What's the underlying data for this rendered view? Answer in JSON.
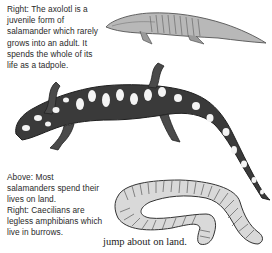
{
  "captions": {
    "axolotl": "Right: The axolotl is a juvenile form of salamander which rarely grows into an adult. It spends the whole of its life as a tadpole.",
    "salamander": "Above: Most salamanders spend their lives on land.",
    "caecilian": "Right: Caecilians are legless amphibians which live in burrows."
  },
  "body_text": "jump about on land.",
  "illustrations": [
    {
      "name": "axolotl",
      "description": "Grey sketch of an axolotl facing left"
    },
    {
      "name": "spotted-salamander",
      "description": "Dark salamander with white spots, head lower left, tail curving down right"
    },
    {
      "name": "caecilian",
      "description": "Ringed, legless worm-like amphibian coiled in a U shape"
    }
  ],
  "colors": {
    "text": "#2a2a2a",
    "ink": "#3a3a3a",
    "background": "#ffffff"
  }
}
